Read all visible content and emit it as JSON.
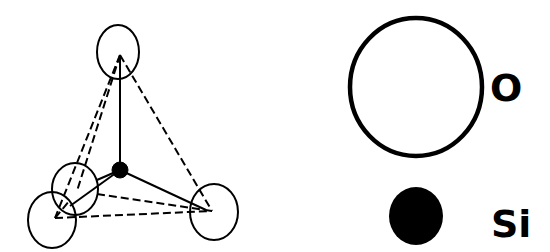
{
  "diagram": {
    "type": "silica tetrahedron (SiO4)",
    "structure": {
      "center_atom": "Si",
      "corner_atoms": [
        "O",
        "O",
        "O",
        "O"
      ]
    },
    "legend": {
      "items": [
        {
          "symbol": "open-circle",
          "label": "O"
        },
        {
          "symbol": "filled-circle",
          "label": "Si"
        }
      ]
    },
    "colors": {
      "stroke": "#000000",
      "background": "#ffffff",
      "si_fill": "#000000"
    }
  }
}
